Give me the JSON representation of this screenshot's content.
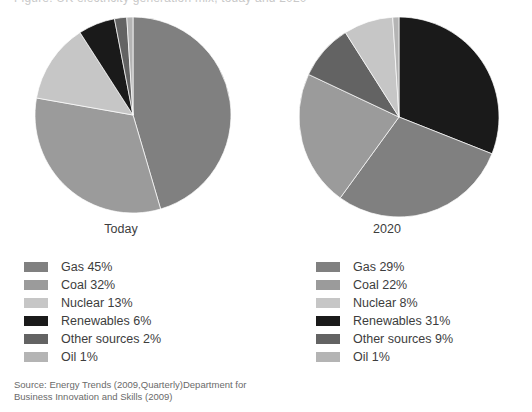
{
  "top_partial_heading": "Figure: UK electricity generation mix, today and 2020",
  "source": {
    "line1": "Source: Energy Trends (2009,Quarterly)Department for",
    "line2": "Business Innovation and Skills (2009)"
  },
  "colors": {
    "gas": "#808080",
    "coal": "#9b9b9b",
    "nuclear": "#c6c6c6",
    "renewables": "#1a1a1a",
    "other_sources": "#636363",
    "oil": "#b4b4b4",
    "background": "#ffffff",
    "text": "#3d3d3d",
    "source_text": "#6a6a6a"
  },
  "charts": [
    {
      "caption": "Today",
      "legend": [
        {
          "label": "Gas 45%",
          "color_key": "gas"
        },
        {
          "label": "Coal 32%",
          "color_key": "coal"
        },
        {
          "label": "Nuclear 13%",
          "color_key": "nuclear"
        },
        {
          "label": "Renewables 6%",
          "color_key": "renewables"
        },
        {
          "label": "Other sources 2%",
          "color_key": "other_sources"
        },
        {
          "label": "Oil 1%",
          "color_key": "oil"
        }
      ]
    },
    {
      "caption": "2020",
      "legend": [
        {
          "label": "Gas 29%",
          "color_key": "gas"
        },
        {
          "label": "Coal 22%",
          "color_key": "coal"
        },
        {
          "label": "Nuclear 8%",
          "color_key": "nuclear"
        },
        {
          "label": "Renewables 31%",
          "color_key": "renewables"
        },
        {
          "label": "Other sources 9%",
          "color_key": "other_sources"
        },
        {
          "label": "Oil 1%",
          "color_key": "oil"
        }
      ]
    }
  ],
  "chart_data": [
    {
      "type": "pie",
      "title": "Today",
      "labels": [
        "Gas",
        "Coal",
        "Nuclear",
        "Renewables",
        "Other sources",
        "Oil"
      ],
      "values": [
        45,
        32,
        13,
        6,
        2,
        1
      ],
      "unit": "%",
      "colors": [
        "#808080",
        "#9b9b9b",
        "#c6c6c6",
        "#1a1a1a",
        "#636363",
        "#b4b4b4"
      ],
      "start_angle_deg": 0,
      "direction": "clockwise",
      "draw_order": [
        "Gas",
        "Coal",
        "Nuclear",
        "Renewables",
        "Other sources",
        "Oil"
      ],
      "legend_position": "below",
      "radius_px": 98
    },
    {
      "type": "pie",
      "title": "2020",
      "labels": [
        "Renewables",
        "Gas",
        "Coal",
        "Other sources",
        "Nuclear",
        "Oil"
      ],
      "values": [
        31,
        29,
        22,
        9,
        8,
        1
      ],
      "unit": "%",
      "colors": [
        "#1a1a1a",
        "#808080",
        "#9b9b9b",
        "#636363",
        "#c6c6c6",
        "#b4b4b4"
      ],
      "start_angle_deg": 0,
      "direction": "clockwise",
      "draw_order": [
        "Renewables",
        "Gas",
        "Coal",
        "Other sources",
        "Nuclear",
        "Oil"
      ],
      "legend_position": "below",
      "radius_px": 100
    }
  ]
}
